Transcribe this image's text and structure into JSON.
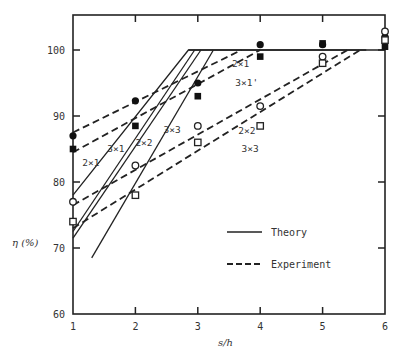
{
  "chart_data": {
    "type": "line",
    "title": "",
    "xlabel": "s/h",
    "ylabel": "η (%)",
    "xlim": [
      1,
      6
    ],
    "ylim": [
      60,
      105
    ],
    "xticks": [
      1,
      2,
      3,
      4,
      5,
      6
    ],
    "yticks": [
      60,
      70,
      80,
      90,
      100
    ],
    "grid": false,
    "legend": {
      "position": "lower right",
      "entries": [
        {
          "label": "Theory",
          "style": "solid"
        },
        {
          "label": "Experiment",
          "style": "dashed"
        }
      ]
    },
    "theory_series": [
      {
        "name": "2x1",
        "style": "solid",
        "points": [
          [
            1,
            78
          ],
          [
            2.85,
            100
          ],
          [
            6,
            100
          ]
        ]
      },
      {
        "name": "3x1",
        "style": "solid",
        "points": [
          [
            1,
            72.5
          ],
          [
            2.95,
            100
          ]
        ]
      },
      {
        "name": "2x2",
        "style": "solid",
        "points": [
          [
            1,
            71.5
          ],
          [
            3.05,
            100
          ]
        ]
      },
      {
        "name": "3x3",
        "style": "solid",
        "points": [
          [
            1.3,
            68.5
          ],
          [
            3.25,
            100
          ]
        ]
      }
    ],
    "experiment_series": [
      {
        "name": "2x1",
        "style": "dashed",
        "marker": "filled-circle",
        "points": [
          [
            1,
            87
          ],
          [
            2,
            92.3
          ],
          [
            3,
            95
          ],
          [
            4,
            100.8
          ],
          [
            5,
            100.8
          ],
          [
            6,
            102
          ]
        ],
        "fit": [
          [
            1,
            87.5
          ],
          [
            3.7,
            100
          ]
        ]
      },
      {
        "name": "3x1",
        "style": "dashed",
        "marker": "filled-square",
        "points": [
          [
            1,
            85
          ],
          [
            2,
            88.5
          ],
          [
            3,
            93
          ],
          [
            4,
            99
          ],
          [
            5,
            101
          ],
          [
            6,
            100.5
          ]
        ],
        "fit": [
          [
            1,
            84.5
          ],
          [
            4.0,
            100
          ]
        ]
      },
      {
        "name": "2x2",
        "style": "dashed",
        "marker": "open-circle",
        "points": [
          [
            1,
            77
          ],
          [
            2,
            82.5
          ],
          [
            3,
            88.5
          ],
          [
            4,
            91.5
          ],
          [
            5,
            99
          ],
          [
            6,
            102.8
          ]
        ],
        "fit": [
          [
            1,
            76.5
          ],
          [
            5.4,
            100
          ]
        ]
      },
      {
        "name": "3x3",
        "style": "dashed",
        "marker": "open-square",
        "points": [
          [
            1,
            74
          ],
          [
            2,
            78
          ],
          [
            3,
            86
          ],
          [
            4,
            88.5
          ],
          [
            5,
            98
          ],
          [
            6,
            101.5
          ]
        ],
        "fit": [
          [
            1,
            73
          ],
          [
            5.6,
            100
          ]
        ]
      }
    ],
    "series_labels": {
      "theory": [
        {
          "text": "2×1",
          "x": 1.15,
          "y": 82.5
        },
        {
          "text": "3×1",
          "x": 1.55,
          "y": 84.5
        },
        {
          "text": "2×2",
          "x": 2.0,
          "y": 85.5
        },
        {
          "text": "3×3",
          "x": 2.45,
          "y": 87.5
        }
      ],
      "experiment": [
        {
          "text": "2×1",
          "x": 3.55,
          "y": 97.5
        },
        {
          "text": "3×1'",
          "x": 3.6,
          "y": 94.5
        },
        {
          "text": "2×2",
          "x": 3.65,
          "y": 87.3
        },
        {
          "text": "3×3",
          "x": 3.7,
          "y": 84.5
        }
      ]
    }
  },
  "axes": {
    "xlabel": "s/h",
    "ylabel": "η (%)",
    "xtick_labels": [
      "1",
      "2",
      "3",
      "4",
      "5",
      "6"
    ],
    "ytick_labels": [
      "60",
      "70",
      "80",
      "90",
      "100"
    ]
  },
  "legend": {
    "theory_label": "Theory",
    "experiment_label": "Experiment"
  }
}
